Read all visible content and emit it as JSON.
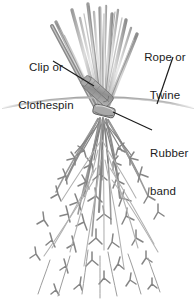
{
  "figure": {
    "width": 196,
    "height": 304,
    "background_color": "#ffffff"
  },
  "labels": {
    "clip": {
      "line1": "Clip or",
      "line2": "Clothespin",
      "text_color": "#1c1c1c"
    },
    "rope": {
      "line1": "Rope or",
      "line2": "Twine",
      "text_color": "#1c1c1c"
    },
    "rubber": {
      "line1": "Rubber",
      "line2": "band",
      "text_color": "#1c1c1c"
    }
  },
  "illustration": {
    "subject": "bundle-of-herbs-hung-upside-down-to-dry",
    "parts": [
      "cut-stems-fanning-upward",
      "wooden-clothespin-clip",
      "horizontal-rope-or-twine",
      "rubber-band-binding-stems",
      "hanging-leafy-foliage"
    ],
    "line_color": "#2b2b2b",
    "stem_color": "#8e8e8e",
    "stem_highlight_color": "#d8d8d8",
    "foliage_color": "#8a8a8a",
    "rope_color": "#b0b0b0",
    "clip_color": "#9a9a9a"
  }
}
